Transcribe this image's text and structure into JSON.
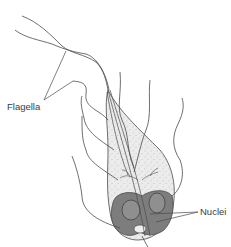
{
  "diagram": {
    "labels": {
      "flagella": "Flagella",
      "nuclei": "Nuclei"
    },
    "colors": {
      "background": "#ffffff",
      "line": "#4a4a4a",
      "body_fill": "#ececec",
      "stipple": "#9a9a9a",
      "nucleus_region": "#7d7d7d",
      "nucleus": "#8f8f8f",
      "label_text": "#3a3a3a"
    }
  }
}
